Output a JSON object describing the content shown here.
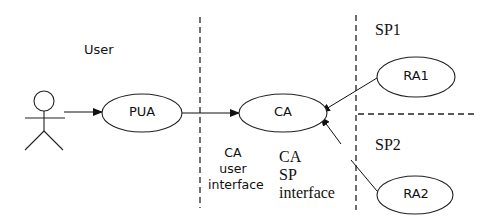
{
  "diagram": {
    "regions": {
      "user": "User",
      "sp1": "SP1",
      "sp2": "SP2"
    },
    "nodes": {
      "pua": "PUA",
      "ca": "CA",
      "ra1": "RA1",
      "ra2": "RA2"
    },
    "interfaces": {
      "ca_user": [
        "CA",
        "user",
        "interface"
      ],
      "ca_sp": [
        "CA",
        "SP",
        "interface"
      ]
    },
    "edges": [
      {
        "from": "User (actor)",
        "to": "PUA"
      },
      {
        "from": "PUA",
        "to": "CA"
      },
      {
        "from": "RA1",
        "to": "CA"
      },
      {
        "from": "RA2",
        "to": "CA"
      }
    ],
    "colors": {
      "stroke": "#111111",
      "background": "#ffffff"
    }
  }
}
